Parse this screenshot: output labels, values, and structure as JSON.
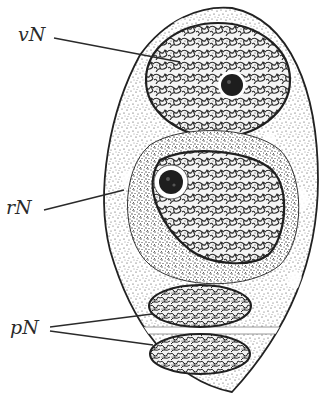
{
  "figure": {
    "type": "biological-stipple-illustration",
    "colors": {
      "ink": "#222222",
      "paper": "#ffffff",
      "cytoplasm_dots": "#3a3a3a",
      "nucleolus": "#1e1e1e"
    },
    "labels": [
      {
        "id": "vN",
        "text": "vN",
        "target": "upper nucleus (round, with nucleolus)"
      },
      {
        "id": "rN",
        "text": "rN",
        "target": "middle nucleus (large, with nucleolus, surrounded by denser zone)"
      },
      {
        "id": "pN",
        "text": "pN",
        "target": "two lower flattened nuclei separated by a clear band"
      }
    ]
  }
}
